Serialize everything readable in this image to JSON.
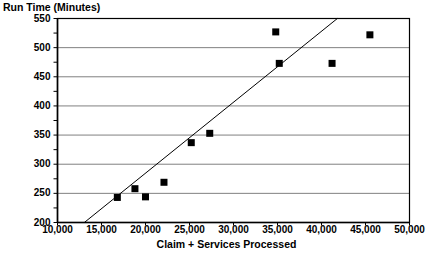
{
  "chart_data": {
    "type": "scatter",
    "title": "",
    "xlabel": "Claim + Services Processed",
    "ylabel": "Run Time (Minutes)",
    "xlim": [
      10000,
      50000
    ],
    "ylim": [
      200,
      550
    ],
    "xticks": [
      10000,
      15000,
      20000,
      25000,
      30000,
      35000,
      40000,
      45000,
      50000
    ],
    "xtick_labels": [
      "10,000",
      "15,000",
      "20,000",
      "25,000",
      "30,000",
      "35,000",
      "40,000",
      "45,000",
      "50,000"
    ],
    "yticks": [
      200,
      250,
      300,
      350,
      400,
      450,
      500,
      550
    ],
    "ytick_labels": [
      "200",
      "250",
      "300",
      "350",
      "400",
      "450",
      "500",
      "550"
    ],
    "y_minor_ticks": [
      225,
      275,
      325,
      375,
      425,
      475,
      525
    ],
    "grid": "horizontal",
    "legend": null,
    "marker": "square",
    "marker_color": "#000000",
    "points": [
      {
        "x": 16800,
        "y": 243
      },
      {
        "x": 18800,
        "y": 258
      },
      {
        "x": 20000,
        "y": 244
      },
      {
        "x": 22100,
        "y": 269
      },
      {
        "x": 25200,
        "y": 337
      },
      {
        "x": 27300,
        "y": 353
      },
      {
        "x": 34800,
        "y": 527
      },
      {
        "x": 35200,
        "y": 473
      },
      {
        "x": 41200,
        "y": 473
      },
      {
        "x": 45500,
        "y": 522
      }
    ],
    "trendline": {
      "x_start": 13050,
      "y_start": 200,
      "x_end": 41800,
      "y_end": 550,
      "color": "#000000"
    }
  },
  "colors": {
    "axis": "#000000",
    "gridline": "#808080",
    "marker": "#000000",
    "trendline": "#000000",
    "background": "#ffffff"
  }
}
